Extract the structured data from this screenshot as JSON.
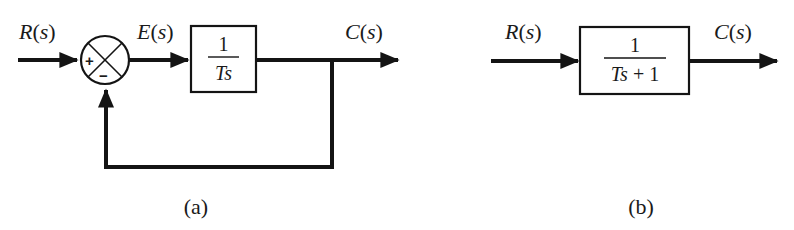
{
  "diagram_a": {
    "caption": "(a)",
    "input_label": "R(s)",
    "error_label": "E(s)",
    "output_label": "C(s)",
    "summing_junction": {
      "plus_sign": "+",
      "minus_sign": "−"
    },
    "block": {
      "numerator": "1",
      "denominator": "Ts"
    },
    "feedback": "unity negative feedback"
  },
  "diagram_b": {
    "caption": "(b)",
    "input_label": "R(s)",
    "output_label": "C(s)",
    "block": {
      "numerator": "1",
      "denominator": "Ts + 1"
    }
  },
  "colors": {
    "line": "#141414",
    "background": "#ffffff"
  }
}
